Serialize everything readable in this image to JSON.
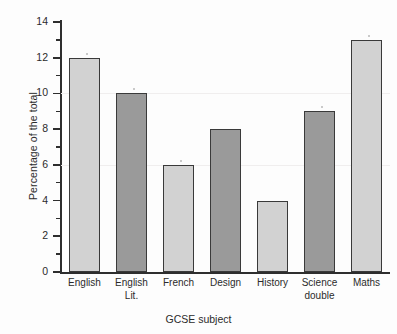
{
  "chart_data": {
    "type": "bar",
    "title": "",
    "xlabel": "GCSE subject",
    "ylabel": "Percentage of the total",
    "categories": [
      "English",
      "English\nLit.",
      "French",
      "Design",
      "History",
      "Science\ndouble",
      "Maths"
    ],
    "values": [
      12,
      10,
      6,
      8,
      4,
      9,
      13
    ],
    "bar_shades": [
      "light",
      "dark",
      "light",
      "dark",
      "light",
      "dark",
      "light"
    ],
    "ylim": [
      0,
      14
    ],
    "ytick_labels": [
      "0",
      "2",
      "4",
      "6",
      "8",
      "10",
      "12",
      "14"
    ],
    "ytick_values": [
      0,
      2,
      4,
      6,
      8,
      10,
      12,
      14
    ],
    "yminor_values": [
      1,
      3,
      5,
      7,
      9,
      11,
      13
    ],
    "grid": "faint-horizontal",
    "legend": "none",
    "colors": {
      "bar_light": "#d2d2d2",
      "bar_dark": "#9a9a9a",
      "bar_outline": "#3a3a3a",
      "axis": "#2e2e2e",
      "text": "#2b2b2b",
      "background": "#fdfdfd"
    }
  }
}
